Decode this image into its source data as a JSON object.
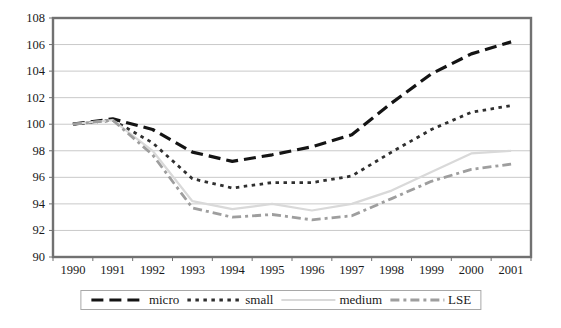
{
  "chart_data": {
    "type": "line",
    "title": "",
    "xlabel": "",
    "ylabel": "",
    "categories": [
      "1990",
      "1991",
      "1992",
      "1993",
      "1994",
      "1995",
      "1996",
      "1997",
      "1998",
      "1999",
      "2000",
      "2001"
    ],
    "series": [
      {
        "name": "micro",
        "values": [
          100,
          100.4,
          99.6,
          97.9,
          97.2,
          97.7,
          98.3,
          99.2,
          101.6,
          103.8,
          105.3,
          106.2
        ],
        "color": "#141414",
        "dash": "12,6",
        "width": 3.2
      },
      {
        "name": "small",
        "values": [
          100,
          100.3,
          98.6,
          95.9,
          95.2,
          95.6,
          95.6,
          96.1,
          97.9,
          99.6,
          100.9,
          101.4
        ],
        "color": "#2f2f2f",
        "dash": "3.5,4.5",
        "width": 2.8
      },
      {
        "name": "medium",
        "values": [
          100,
          100.3,
          98.0,
          94.2,
          93.6,
          94.0,
          93.5,
          94.0,
          95.0,
          96.4,
          97.8,
          98.0
        ],
        "color": "#d9d9d9",
        "dash": "",
        "width": 2.2
      },
      {
        "name": "LSE",
        "values": [
          100,
          100.3,
          97.7,
          93.7,
          93.0,
          93.2,
          92.8,
          93.1,
          94.4,
          95.7,
          96.6,
          97.0
        ],
        "color": "#9e9e9e",
        "dash": "9,4,3,4",
        "width": 2.8
      }
    ],
    "ylim": [
      90,
      108
    ],
    "y_ticks": [
      "90",
      "92",
      "94",
      "96",
      "98",
      "100",
      "102",
      "104",
      "106",
      "108"
    ],
    "grid": "horizontal",
    "legend_position": "bottom",
    "colors": {
      "frame": "#717171",
      "grid": "#c9c9c9",
      "text": "#1a1a1a",
      "legend_border": "#a8a8a8",
      "background": "#ffffff"
    }
  }
}
